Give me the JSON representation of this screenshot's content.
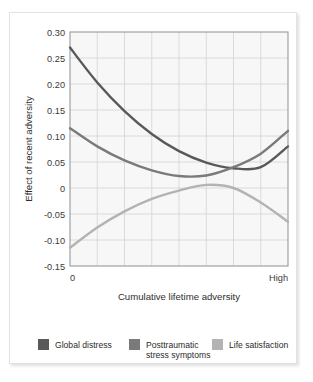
{
  "chart_data": {
    "type": "line",
    "title": "",
    "xlabel": "Cumulative lifetime adversity",
    "ylabel": "Effect of recent adversity",
    "xlim": [
      0,
      1
    ],
    "ylim": [
      -0.15,
      0.3
    ],
    "grid": true,
    "legend_position": "bottom",
    "x_tick_labels": [
      "0",
      "High"
    ],
    "y_tick_labels": [
      "0.30",
      "0.25",
      "0.20",
      "0.15",
      "0.10",
      "0.05",
      "0",
      "-0.05",
      "-0.10",
      "-0.15"
    ],
    "y_tick_values": [
      0.3,
      0.25,
      0.2,
      0.15,
      0.1,
      0.05,
      0,
      -0.05,
      -0.1,
      -0.15
    ],
    "x_gridline_count": 7,
    "series": [
      {
        "name": "Global distress",
        "color": "#595959",
        "x": [
          0.0,
          0.125,
          0.25,
          0.375,
          0.5,
          0.625,
          0.75,
          0.875,
          1.0
        ],
        "values": [
          0.27,
          0.203,
          0.148,
          0.104,
          0.071,
          0.049,
          0.038,
          0.04,
          0.08
        ]
      },
      {
        "name": "Posttraumatic stress symptoms",
        "color": "#7a7a7a",
        "x": [
          0.0,
          0.125,
          0.25,
          0.375,
          0.5,
          0.625,
          0.75,
          0.875,
          1.0
        ],
        "values": [
          0.115,
          0.08,
          0.053,
          0.034,
          0.023,
          0.024,
          0.04,
          0.066,
          0.11
        ]
      },
      {
        "name": "Life satisfaction",
        "color": "#b3b3b3",
        "x": [
          0.0,
          0.125,
          0.25,
          0.375,
          0.5,
          0.625,
          0.75,
          0.875,
          1.0
        ],
        "values": [
          -0.115,
          -0.076,
          -0.045,
          -0.021,
          -0.005,
          0.006,
          0.0,
          -0.028,
          -0.065
        ]
      }
    ]
  },
  "axes": {
    "y_title": "Effect of recent adversity",
    "x_title": "Cumulative lifetime adversity",
    "x_min_label": "0",
    "x_max_label": "High",
    "y_labels": {
      "t0": "0.30",
      "t1": "0.25",
      "t2": "0.20",
      "t3": "0.15",
      "t4": "0.10",
      "t5": "0.05",
      "t6": "0",
      "t7": "-0.05",
      "t8": "-0.10",
      "t9": "-0.15"
    }
  },
  "legend": {
    "items": [
      {
        "label": "Global distress",
        "color": "#595959"
      },
      {
        "label_line1": "Posttraumatic",
        "label_line2": "stress symptoms",
        "color": "#7a7a7a"
      },
      {
        "label": "Life satisfaction",
        "color": "#b3b3b3"
      }
    ]
  },
  "colors": {
    "plot_background": "#f7f7f7",
    "grid": "#d6d6d6",
    "axis": "#9a9a9a",
    "text": "#2e2e2e",
    "series_dark": "#595959",
    "series_medium": "#7a7a7a",
    "series_light": "#b3b3b3"
  }
}
